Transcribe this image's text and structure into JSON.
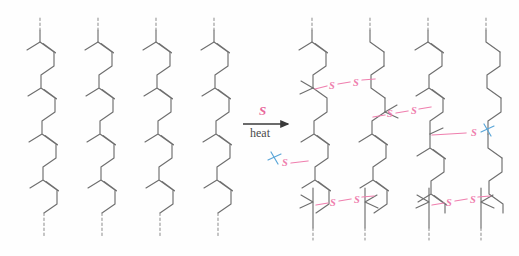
{
  "figure": {
    "background_color": "#fefefe",
    "bond_color": "#6e6e6e",
    "sulfur_color": "#ef7fae",
    "mark_color": "#5aa6d8",
    "dash_color": "#8f8f8f"
  },
  "arrow": {
    "reagent_label": "S",
    "condition_label": "heat",
    "arrow_color": "#3a3a3a",
    "reagent_color": "#e8679b",
    "x": 243,
    "y": 104,
    "width": 48
  },
  "left_panel": {
    "name": "uncrosslinked-polyisoprene",
    "chain_count": 4,
    "chain_x_positions": [
      40,
      98,
      156,
      214
    ],
    "repeat_units_per_chain": 3,
    "has_crosslinks": false,
    "terminal_marker": "dashed-bond"
  },
  "right_panel": {
    "name": "vulcanized-crosslinked-rubber",
    "chain_count": 4,
    "chain_x_positions": [
      312,
      370,
      428,
      486
    ],
    "repeat_units_per_chain": 3,
    "has_crosslinks": true,
    "terminal_marker": "dashed-bond",
    "crosslinks": [
      {
        "id": "crosslink-1",
        "type": "disulfide",
        "labels": [
          "S",
          "S"
        ],
        "chains": [
          1,
          2
        ],
        "y": 60
      },
      {
        "id": "crosslink-2",
        "type": "disulfide",
        "labels": [
          "S",
          "S"
        ],
        "chains": [
          2,
          3
        ],
        "y": 88
      },
      {
        "id": "crosslink-3",
        "type": "disulfide",
        "labels": [
          "S",
          "S"
        ],
        "chains": [
          1,
          2
        ],
        "y": 210
      },
      {
        "id": "crosslink-4",
        "type": "disulfide",
        "labels": [
          "S",
          "S"
        ],
        "chains": [
          3,
          4
        ],
        "y": 210
      }
    ],
    "dangling_sulfurs": [
      {
        "id": "dangling-s-right",
        "label": "S",
        "mark": "squiggle",
        "x": 474,
        "y": 97
      },
      {
        "id": "dangling-s-left",
        "label": "S",
        "mark": "squiggle",
        "x": 281,
        "y": 163
      }
    ]
  }
}
